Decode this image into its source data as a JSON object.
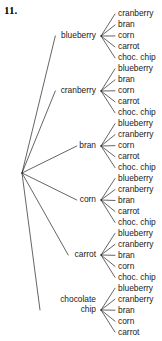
{
  "problem": {
    "number": "11."
  },
  "diagram": {
    "type": "tree-diagram",
    "title": "",
    "root": {
      "label": "",
      "x": 22,
      "y": 173
    },
    "line_color": "#222222",
    "text_color": "#1a1a1a",
    "background_color": "#ffffff",
    "branch_hub_x": 101,
    "leaf_text_x": 118,
    "first_leaf_y": 14,
    "leaf_spacing": 10.97,
    "level1_items": [
      "blueberry",
      "cranberry",
      "bran",
      "corn",
      "chocolate chip",
      "carrot"
    ],
    "branches": [
      {
        "label": "blueberry",
        "label_x": 96,
        "label_y": 36,
        "two_line": false,
        "hub_y": 36,
        "leaves": [
          "cranberry",
          "bran",
          "corn",
          "carrot",
          "choc. chip"
        ]
      },
      {
        "label": "cranberry",
        "label_x": 96,
        "label_y": 91,
        "two_line": false,
        "hub_y": 91,
        "leaves": [
          "blueberry",
          "bran",
          "corn",
          "carrot",
          "choc. chip"
        ]
      },
      {
        "label": "bran",
        "label_x": 96,
        "label_y": 146,
        "two_line": false,
        "hub_y": 146,
        "leaves": [
          "blueberry",
          "cranberry",
          "corn",
          "carrot",
          "choc. chip"
        ]
      },
      {
        "label": "corn",
        "label_x": 96,
        "label_y": 200,
        "two_line": false,
        "hub_y": 200,
        "leaves": [
          "blueberry",
          "cranberry",
          "bran",
          "carrot",
          "choc. chip"
        ]
      },
      {
        "label": "carrot",
        "label_x": 96,
        "label_y": 255,
        "two_line": false,
        "hub_y": 255,
        "leaves": [
          "blueberry",
          "cranberry",
          "bran",
          "corn",
          "choc. chip"
        ]
      },
      {
        "label": "chocolate chip",
        "label_x": 96,
        "label_y": 305,
        "two_line": true,
        "hub_y": 310,
        "leaves": [
          "blueberry",
          "cranberry",
          "bran",
          "corn",
          "carrot"
        ]
      }
    ]
  }
}
